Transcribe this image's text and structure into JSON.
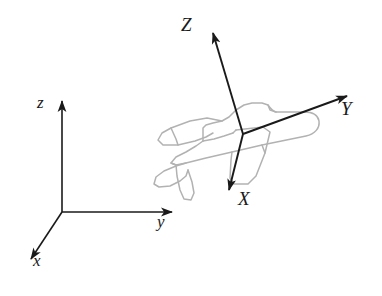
{
  "figure": {
    "background_color": "#ffffff",
    "width": 382,
    "height": 296
  },
  "colors": {
    "axis_stroke": "#1a1a1a",
    "aircraft_stroke": "#b0b0b0",
    "label_color": "#1a1a1a",
    "background": "#ffffff"
  },
  "inertial_frame": {
    "name": "inertial-reference-frame",
    "origin": {
      "x": 62,
      "y": 212
    },
    "axes": [
      {
        "label": "z",
        "name": "inertial-axis-z",
        "direction": "up",
        "tip": {
          "x": 62,
          "y": 97
        },
        "label_pos": {
          "x": 40,
          "y": 100
        }
      },
      {
        "label": "y",
        "name": "inertial-axis-y",
        "direction": "right",
        "tip": {
          "x": 177,
          "y": 212
        },
        "label_pos": {
          "x": 159,
          "y": 219
        }
      },
      {
        "label": "x",
        "name": "inertial-axis-x",
        "direction": "down-left",
        "tip": {
          "x": 27,
          "y": 263
        },
        "label_pos": {
          "x": 34,
          "y": 258
        }
      }
    ]
  },
  "body_frame": {
    "name": "aircraft-body-fixed-frame",
    "origin": {
      "x": 243,
      "y": 134
    },
    "axes": [
      {
        "label": "Z",
        "name": "body-axis-z",
        "direction": "up-slightly-left",
        "tip": {
          "x": 211,
          "y": 27
        },
        "label_pos": {
          "x": 184,
          "y": 23
        }
      },
      {
        "label": "Y",
        "name": "body-axis-y",
        "direction": "up-right",
        "tip": {
          "x": 353,
          "y": 92
        },
        "label_pos": {
          "x": 343,
          "y": 108
        }
      },
      {
        "label": "X",
        "name": "body-axis-x",
        "direction": "down-slightly-left",
        "tip": {
          "x": 230,
          "y": 196
        },
        "label_pos": {
          "x": 238,
          "y": 196
        }
      }
    ]
  },
  "aircraft": {
    "name": "aircraft-outline",
    "style": "light gray line drawing, dotted/stippled edges",
    "parts": [
      "fuselage",
      "nose",
      "cockpit",
      "left-wing",
      "right-wing",
      "vertical-stabilizer",
      "horizontal-stabilizer",
      "tail"
    ]
  }
}
